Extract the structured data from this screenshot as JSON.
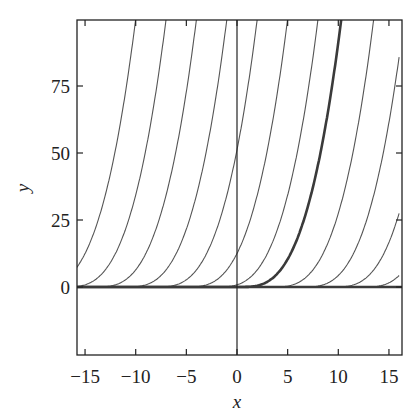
{
  "chart_data": {
    "type": "line",
    "title": "",
    "xlabel": "x",
    "ylabel": "y",
    "xlim": [
      -16,
      16
    ],
    "ylim": [
      -26,
      98
    ],
    "x_ticks": [
      -15,
      -10,
      -5,
      0,
      5,
      10,
      15
    ],
    "x_tick_labels": [
      "−15",
      "−10",
      "−5",
      "0",
      "5",
      "10",
      "15"
    ],
    "y_ticks": [
      0,
      25,
      50,
      75
    ],
    "y_tick_labels": [
      "0",
      "25",
      "50",
      "75"
    ],
    "grid": false,
    "legend": null,
    "formula": "y = (x - c)^3 / 10, x >= c; y = 0 otherwise",
    "series": [
      {
        "name": "c=-20",
        "c": -20,
        "bold": false
      },
      {
        "name": "c=-17",
        "c": -17,
        "bold": false
      },
      {
        "name": "c=-14",
        "c": -14,
        "bold": false
      },
      {
        "name": "c=-11",
        "c": -11,
        "bold": false
      },
      {
        "name": "c=-8",
        "c": -8,
        "bold": false
      },
      {
        "name": "c=-5",
        "c": -5,
        "bold": false
      },
      {
        "name": "c=-2",
        "c": -2,
        "bold": false
      },
      {
        "name": "c=0",
        "c": 0.3,
        "bold": true
      },
      {
        "name": "c=4",
        "c": 3.5,
        "bold": false
      },
      {
        "name": "c=7",
        "c": 6.5,
        "bold": false
      },
      {
        "name": "c=10",
        "c": 9.5,
        "bold": false
      },
      {
        "name": "c=13",
        "c": 12.5,
        "bold": false
      },
      {
        "name": "y=0",
        "c": null,
        "bold": true
      }
    ]
  },
  "colors": {
    "curve": "#555555",
    "bold_curve": "#3a3a3a",
    "axis": "#222222",
    "background": "#ffffff"
  }
}
